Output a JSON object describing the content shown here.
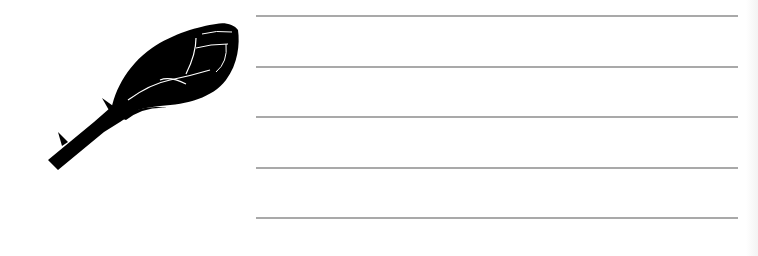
{
  "note_paper": {
    "illustration": {
      "icon": "rose-bud-silhouette-icon",
      "fill_color": "#000000",
      "vein_color": "#ffffff"
    },
    "lines": {
      "count": 5,
      "color": "#a9a9a9",
      "positions_y": [
        15,
        66,
        116,
        167,
        217
      ]
    },
    "background_color": "#ffffff"
  }
}
